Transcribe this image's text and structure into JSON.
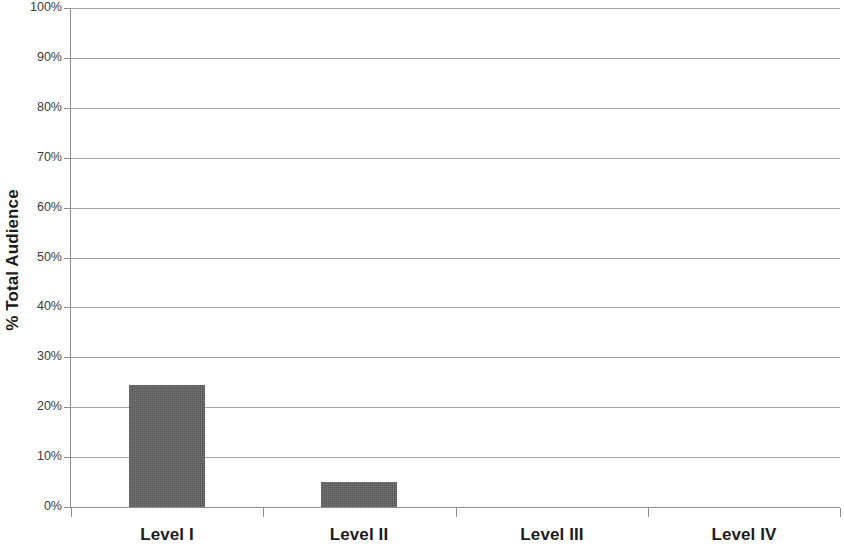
{
  "chart_data": {
    "type": "bar",
    "title": "",
    "subtitle": "",
    "xlabel": "",
    "ylabel": "% Total Audience",
    "categories": [
      "Level I",
      "Level II",
      "Level III",
      "Level IV"
    ],
    "values": [
      24.5,
      5,
      0,
      0
    ],
    "series": [
      {
        "name": "% Total Audience",
        "values": [
          24.5,
          5,
          0,
          0
        ]
      }
    ],
    "ylim": [
      0,
      100
    ],
    "y_tick_labels": [
      "100%",
      "90%",
      "80%",
      "70%",
      "60%",
      "50%",
      "40%",
      "30%",
      "20%",
      "10%",
      "0%"
    ],
    "y_tick_values": [
      100,
      90,
      80,
      70,
      60,
      50,
      40,
      30,
      20,
      10,
      0
    ],
    "y_tick_suffix": "%",
    "grid": "horizontal",
    "legend": "none",
    "bar_color": "#636363",
    "gridline_color": "#a6a6a6",
    "axis_color": "#8c8c8c",
    "text_color": "#1c1c1c",
    "tick_text_color": "#3a3a3a",
    "annotations": []
  }
}
